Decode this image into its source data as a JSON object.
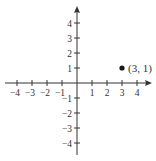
{
  "chart_data": {
    "type": "scatter",
    "title": "",
    "xlabel": "",
    "ylabel": "",
    "xlim": [
      -4.5,
      4.5
    ],
    "ylim": [
      -4.5,
      4.5
    ],
    "x_ticks": [
      -4,
      -3,
      -2,
      -1,
      1,
      2,
      3,
      4
    ],
    "y_ticks": [
      4,
      3,
      2,
      1,
      -1,
      -2,
      -3,
      -4
    ],
    "x_tick_labels": [
      "−4",
      "−3",
      "−2",
      "−1",
      "1",
      "2",
      "3",
      "4"
    ],
    "y_tick_labels": [
      "4",
      "3",
      "2",
      "1",
      "−1",
      "−2",
      "−3",
      "−4"
    ],
    "grid": false,
    "points": [
      {
        "x": 3,
        "y": 1,
        "label": "(3, 1)"
      }
    ],
    "axis_arrows": {
      "x_positive": true,
      "y_positive": true
    }
  },
  "colors": {
    "axis": "#333333",
    "point": "#1a1a1a",
    "text": "#333333"
  }
}
